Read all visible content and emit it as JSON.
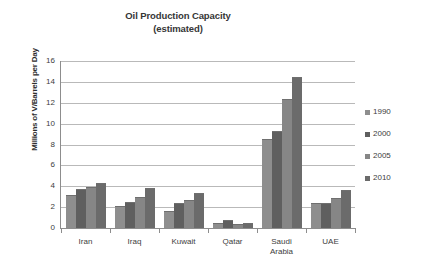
{
  "chart_data": {
    "type": "bar",
    "title": "Oil Production Capacity",
    "subtitle": "(estimated)",
    "xlabel": "",
    "ylabel": "Millions of V/Barrels per Day",
    "ylim": [
      0,
      16
    ],
    "yticks": [
      0,
      2,
      4,
      6,
      8,
      10,
      12,
      14,
      16
    ],
    "grid": true,
    "legend_position": "right",
    "categories": [
      "Iran",
      "Iraq",
      "Kuwait",
      "Qatar",
      "Saudi Arabia",
      "UAE"
    ],
    "category_lines": [
      [
        "Iran"
      ],
      [
        "Iraq"
      ],
      [
        "Kuwait"
      ],
      [
        "Qatar"
      ],
      [
        "Saudi",
        "Arabia"
      ],
      [
        "UAE"
      ]
    ],
    "series": [
      {
        "name": "1990",
        "color": "#8e8e8e",
        "values": [
          3.15,
          2.1,
          1.65,
          0.45,
          8.5,
          2.4
        ]
      },
      {
        "name": "2000",
        "color": "#5f5f5f",
        "values": [
          3.75,
          2.5,
          2.4,
          0.75,
          9.3,
          2.4
        ]
      },
      {
        "name": "2005",
        "color": "#868686",
        "values": [
          3.9,
          3.0,
          2.65,
          0.42,
          12.4,
          2.9
        ]
      },
      {
        "name": "2010",
        "color": "#6b6b6b",
        "values": [
          4.3,
          3.8,
          3.4,
          0.5,
          14.5,
          3.65
        ]
      }
    ]
  }
}
